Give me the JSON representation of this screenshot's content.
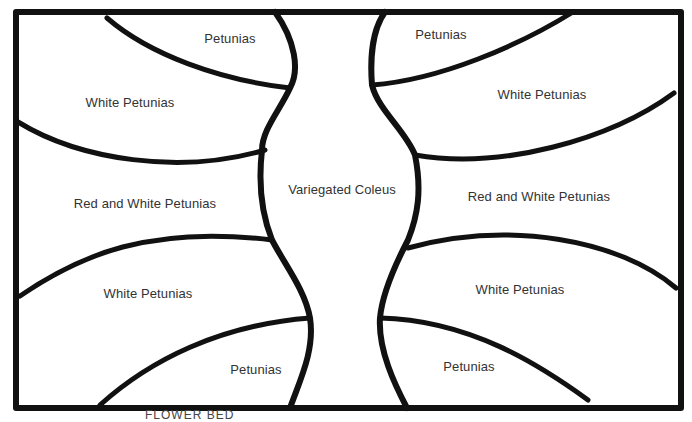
{
  "diagram": {
    "caption": "FLOWER BED",
    "regions": [
      {
        "label": "Petunias",
        "x": 230,
        "y": 38
      },
      {
        "label": "White Petunias",
        "x": 130,
        "y": 102
      },
      {
        "label": "Red and White Petunias",
        "x": 145,
        "y": 203
      },
      {
        "label": "White Petunias",
        "x": 148,
        "y": 293
      },
      {
        "label": "Petunias",
        "x": 256,
        "y": 369
      },
      {
        "label": "Variegated Coleus",
        "x": 342,
        "y": 189
      },
      {
        "label": "Petunias",
        "x": 441,
        "y": 34
      },
      {
        "label": "White Petunias",
        "x": 542,
        "y": 94
      },
      {
        "label": "Red and White Petunias",
        "x": 539,
        "y": 196
      },
      {
        "label": "White Petunias",
        "x": 520,
        "y": 289
      },
      {
        "label": "Petunias",
        "x": 469,
        "y": 366
      }
    ]
  }
}
